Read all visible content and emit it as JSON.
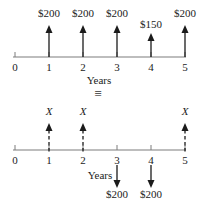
{
  "figure": {
    "equivalence_symbol": "≡",
    "top": {
      "axis_label": "Years",
      "tick_labels": [
        "0",
        "1",
        "2",
        "3",
        "4",
        "5"
      ],
      "cash_flows": [
        {
          "year": 1,
          "label": "$200",
          "direction": "up",
          "line": "solid",
          "size": "full"
        },
        {
          "year": 2,
          "label": "$200",
          "direction": "up",
          "line": "solid",
          "size": "full"
        },
        {
          "year": 3,
          "label": "$200",
          "direction": "up",
          "line": "solid",
          "size": "full"
        },
        {
          "year": 4,
          "label": "$150",
          "direction": "up",
          "line": "solid",
          "size": "short"
        },
        {
          "year": 5,
          "label": "$200",
          "direction": "up",
          "line": "solid",
          "size": "full"
        }
      ]
    },
    "bottom": {
      "axis_label": "Years",
      "tick_labels": [
        "0",
        "1",
        "2",
        "3",
        "4",
        "5"
      ],
      "cash_flows": [
        {
          "year": 1,
          "label": "X",
          "direction": "up",
          "line": "dashed",
          "size": "full"
        },
        {
          "year": 2,
          "label": "X",
          "direction": "up",
          "line": "dashed",
          "size": "full"
        },
        {
          "year": 3,
          "label": "$200",
          "direction": "down",
          "line": "solid",
          "size": "full"
        },
        {
          "year": 4,
          "label": "$200",
          "direction": "down",
          "line": "solid",
          "size": "full"
        },
        {
          "year": 5,
          "label": "X",
          "direction": "up",
          "line": "dashed",
          "size": "full"
        }
      ]
    },
    "colors": {
      "axis": "#7d7d7d",
      "arrow": "#1b1b1b",
      "text": "#1b1b1b",
      "equivalence": "#5a5a5a"
    }
  }
}
